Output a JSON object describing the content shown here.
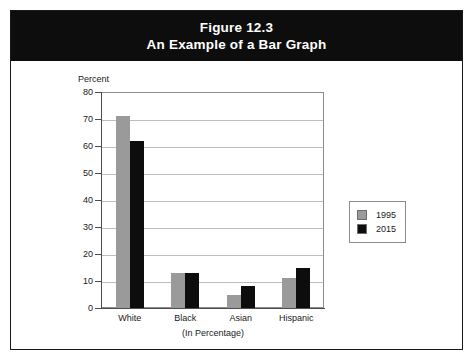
{
  "figure": {
    "title_line1": "Figure 12.3",
    "title_line2": "An Example of a Bar Graph"
  },
  "chart_data": {
    "type": "bar",
    "title": "An Example of a Bar Graph",
    "subtitle": "Figure 12.3",
    "categories": [
      "White",
      "Black",
      "Asian",
      "Hispanic"
    ],
    "series": [
      {
        "name": "1995",
        "color": "#9a9a9a",
        "values": [
          71,
          13,
          5,
          11
        ]
      },
      {
        "name": "2015",
        "color": "#0d0d0d",
        "values": [
          62,
          13,
          8,
          15
        ]
      }
    ],
    "xlabel": "(In Percentage)",
    "ylabel": "Percent",
    "ylim": [
      0,
      80
    ],
    "ytick_step": 10,
    "yticks": [
      0,
      10,
      20,
      30,
      40,
      50,
      60,
      70,
      80
    ],
    "ytick_labels": [
      "0",
      "10",
      "20",
      "30",
      "40",
      "50",
      "60",
      "70",
      "80"
    ],
    "grid": true,
    "legend_position": "right"
  },
  "legend": {
    "entries": [
      {
        "label": "1995",
        "color": "#9a9a9a"
      },
      {
        "label": "2015",
        "color": "#0d0d0d"
      }
    ]
  },
  "colors": {
    "series_1995": "#9a9a9a",
    "series_2015": "#0d0d0d",
    "banner_background": "#0d0d0d",
    "banner_text": "#ffffff",
    "gridline": "#bdbdbd",
    "axis": "#4d4d4d",
    "card_border": "#1a1a1a"
  }
}
